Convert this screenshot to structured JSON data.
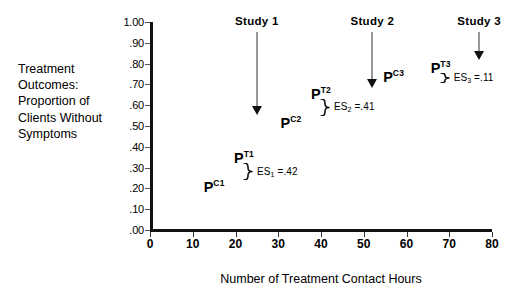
{
  "chart_data": {
    "type": "scatter",
    "title": "",
    "xlabel": "Number of Treatment Contact Hours",
    "ylabel": "Treatment Outcomes: Proportion of Clients Without Symptoms",
    "xlim": [
      0,
      80
    ],
    "ylim": [
      0.0,
      1.0
    ],
    "grid": false,
    "legend": null,
    "x_ticks": [
      "0",
      "10",
      "20",
      "30",
      "40",
      "50",
      "60",
      "70",
      "80"
    ],
    "x_tick_values": [
      0,
      10,
      20,
      30,
      40,
      50,
      60,
      70,
      80
    ],
    "y_ticks": [
      "1.00",
      ".90",
      ".80",
      ".70",
      ".60",
      ".50",
      ".40",
      ".30",
      ".20",
      ".10",
      ".00"
    ],
    "y_tick_values": [
      1.0,
      0.9,
      0.8,
      0.7,
      0.6,
      0.5,
      0.4,
      0.3,
      0.2,
      0.1,
      0.0
    ],
    "points": [
      {
        "id": "pc1",
        "label": "P",
        "sup": "C1",
        "x": 15,
        "y": 0.215,
        "study": 1,
        "group": "control"
      },
      {
        "id": "pt1",
        "label": "P",
        "sup": "T1",
        "x": 22,
        "y": 0.355,
        "study": 1,
        "group": "treatment"
      },
      {
        "id": "pc2",
        "label": "P",
        "sup": "C2",
        "x": 33,
        "y": 0.525,
        "study": 2,
        "group": "control"
      },
      {
        "id": "pt2",
        "label": "P",
        "sup": "T2",
        "x": 40,
        "y": 0.665,
        "study": 2,
        "group": "treatment"
      },
      {
        "id": "pc3",
        "label": "P",
        "sup": "C3",
        "x": 57,
        "y": 0.745,
        "study": 3,
        "group": "control"
      },
      {
        "id": "pt3",
        "label": "P",
        "sup": "T3",
        "x": 68,
        "y": 0.79,
        "study": 3,
        "group": "treatment"
      }
    ],
    "studies": [
      {
        "id": 1,
        "label": "Study 1",
        "arrow_x": 25,
        "arrow_top": 0.95,
        "arrow_bottom": 0.555,
        "es_text": "ES",
        "es_sub": "1",
        "es_value": "=.42",
        "effect_size": 0.42
      },
      {
        "id": 2,
        "label": "Study 2",
        "arrow_x": 52,
        "arrow_top": 0.95,
        "arrow_bottom": 0.685,
        "es_text": "ES",
        "es_sub": "2",
        "es_value": "=.41",
        "effect_size": 0.41
      },
      {
        "id": 3,
        "label": "Study 3",
        "arrow_x": 77,
        "arrow_top": 0.95,
        "arrow_bottom": 0.815,
        "es_text": "ES",
        "es_sub": "3",
        "es_value": "=.11",
        "effect_size": 0.11
      }
    ],
    "colors": {
      "axis": "#111111",
      "text": "#000000",
      "arrow": "#333333",
      "brace": "#111111"
    }
  }
}
